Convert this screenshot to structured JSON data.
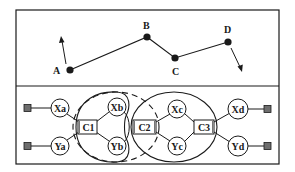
{
  "colors": {
    "ink": "#1a1a1a",
    "terminal_fill": "#6e6e6e",
    "background": "#ffffff"
  },
  "top_panel": {
    "points": [
      {
        "id": "A",
        "label": "A",
        "x": 70,
        "y": 70
      },
      {
        "id": "B",
        "label": "B",
        "x": 147,
        "y": 37
      },
      {
        "id": "C",
        "label": "C",
        "x": 175,
        "y": 58
      },
      {
        "id": "D",
        "label": "D",
        "x": 228,
        "y": 42
      }
    ],
    "arrows": [
      {
        "from": "A",
        "direction": "up"
      },
      {
        "from": "D",
        "direction": "down"
      }
    ]
  },
  "bottom_panel": {
    "nodes": {
      "Xa": "Xa",
      "Ya": "Ya",
      "Xb": "Xb",
      "Yb": "Yb",
      "Xc": "Xc",
      "Yc": "Yc",
      "Xd": "Xd",
      "Yd": "Yd"
    },
    "connectors": {
      "C1": "C1",
      "C2": "C2",
      "C3": "C3"
    },
    "groups": [
      {
        "name": "group-c1",
        "style": "solid"
      },
      {
        "name": "group-c1-c2",
        "style": "dashed"
      },
      {
        "name": "group-c2-c3",
        "style": "solid"
      }
    ]
  }
}
